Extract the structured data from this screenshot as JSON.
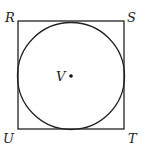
{
  "diagram": {
    "square": {
      "x": 18,
      "y": 21,
      "width": 106,
      "height": 108,
      "stroke": "#222222"
    },
    "circle": {
      "cx": 71,
      "cy": 76,
      "r": 53,
      "stroke": "#222222"
    },
    "center_point": {
      "cx": 71,
      "cy": 76,
      "r": 1.8,
      "fill": "#111111"
    },
    "labels": {
      "R": "R",
      "S": "S",
      "T": "T",
      "U": "U",
      "V": "V"
    }
  }
}
